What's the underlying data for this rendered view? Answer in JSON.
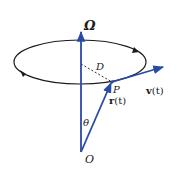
{
  "diagram": {
    "labels": {
      "omega": "Ω",
      "d": "D",
      "p": "P",
      "v_bold": "v",
      "v_arg": "(t)",
      "r_bold": "r",
      "r_arg": "(t)",
      "theta": "θ",
      "origin": "O"
    },
    "colors": {
      "vector": "#2a4aa8",
      "orbit": "#1a1a1a",
      "dashed": "#333333",
      "background": "#ffffff"
    },
    "elements": {
      "orbit": "elliptical orbit with direction arrows (counterclockwise when viewed from above)",
      "rotation_axis": "Ω angular velocity axis from origin O",
      "position_vector": "r(t) from O to point P",
      "velocity_vector": "v(t) tangent at P",
      "radius": "D dashed perpendicular from axis to P",
      "angle": "θ between axis and r(t)"
    }
  }
}
